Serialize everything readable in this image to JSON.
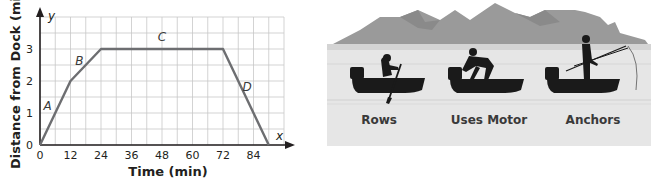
{
  "chart_data": {
    "type": "line",
    "title": "",
    "xlabel": "Time (min)",
    "ylabel": "Distance from Dock (mi)",
    "x_axis_letter": "x",
    "y_axis_letter": "y",
    "xticks": [
      "0",
      "12",
      "24",
      "36",
      "48",
      "60",
      "72",
      "84"
    ],
    "yticks": [
      "0",
      "1",
      "2",
      "3"
    ],
    "xlim": [
      0,
      96
    ],
    "ylim": [
      0,
      4
    ],
    "grid": true,
    "grid_step_x": 6,
    "grid_step_y": 0.5,
    "series": [
      {
        "name": "Boat distance",
        "x": [
          0,
          12,
          24,
          72,
          90
        ],
        "y": [
          0,
          2,
          3,
          3,
          0
        ]
      }
    ],
    "segment_labels": [
      {
        "label": "A",
        "x": 3,
        "y": 1.1
      },
      {
        "label": "B",
        "x": 15.5,
        "y": 2.5
      },
      {
        "label": "C",
        "x": 48,
        "y": 3.25
      },
      {
        "label": "D",
        "x": 81.5,
        "y": 1.7
      }
    ],
    "annotations": []
  },
  "illustration": {
    "labels": [
      {
        "text": "Rows"
      },
      {
        "text": "Uses Motor"
      },
      {
        "text": "Anchors"
      }
    ]
  },
  "colors": {
    "line": "#6d6e71",
    "grid": "#c8c8c8",
    "axis": "#231f20",
    "mountain": "#9a9a9a",
    "water": "#e6e6e6",
    "silhouette": "#1a1a1a"
  }
}
